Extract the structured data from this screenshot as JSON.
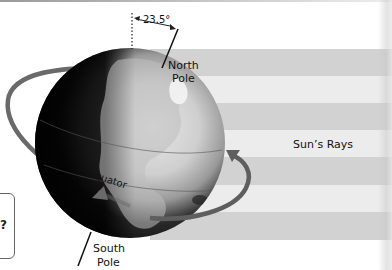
{
  "diagram": {
    "angle_label": "23.5°",
    "north_pole_label": [
      "North",
      "Pole"
    ],
    "south_pole_label": [
      "South",
      "Pole"
    ],
    "equator_label": "Equator",
    "sun_rays_label": "Sun’s Rays",
    "question_glyph": "?"
  },
  "colors": {
    "band_dark": "#d2d2d2",
    "band_light": "#ececec",
    "orbit_arrow": "#6a6a6a",
    "globe_dark": "#0a0a0a",
    "globe_light": "#d8d8d8"
  },
  "bands": [
    {
      "tone": "dark",
      "top": 49,
      "height": 27
    },
    {
      "tone": "light",
      "top": 76,
      "height": 27
    },
    {
      "tone": "dark",
      "top": 103,
      "height": 27
    },
    {
      "tone": "light",
      "top": 130,
      "height": 27
    },
    {
      "tone": "dark",
      "top": 157,
      "height": 28
    },
    {
      "tone": "light",
      "top": 185,
      "height": 27
    },
    {
      "tone": "dark",
      "top": 212,
      "height": 28
    }
  ]
}
